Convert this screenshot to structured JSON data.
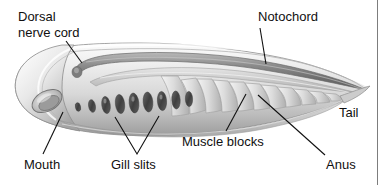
{
  "figure": {
    "organism": "lancelet",
    "orientation": "head at left, tail at right",
    "background_color": "#ffffff",
    "border_color": "#7d7d7d",
    "text_color": "#101010",
    "body_fill_light": "#f2f2f2",
    "body_fill_mid": "#cfcfcf",
    "body_fill_dark": "#8f8f8f",
    "nerve_cord_color": "#707070",
    "gill_slit_color": "#4d4d4d"
  },
  "labels": {
    "dorsal_nerve_cord_line1": "Dorsal",
    "dorsal_nerve_cord_line2": "nerve cord",
    "notochord": "Notochord",
    "tail": "Tail",
    "anus": "Anus",
    "muscle_blocks": "Muscle blocks",
    "gill_slits": "Gill slits",
    "mouth": "Mouth"
  },
  "callouts": [
    {
      "name": "dorsal-nerve-cord",
      "text": "Dorsal nerve cord",
      "text_x": 18,
      "text_y": 10,
      "leader": [
        [
          66,
          41
        ],
        [
          82,
          62
        ]
      ],
      "target": "dorsal hollow nerve cord running along the top of the body"
    },
    {
      "name": "notochord",
      "text": "Notochord",
      "text_x": 259,
      "text_y": 10,
      "leader": [
        [
          262,
          27
        ],
        [
          265,
          62
        ]
      ],
      "target": "notochord, stiff rod beneath the nerve cord"
    },
    {
      "name": "tail",
      "text": "Tail",
      "text_x": 339,
      "text_y": 106,
      "leader": [],
      "target": "pointed posterior tail"
    },
    {
      "name": "anus",
      "text": "Anus",
      "text_x": 327,
      "text_y": 159,
      "leader": [
        [
          325,
          157
        ],
        [
          258,
          95
        ]
      ],
      "target": "anus on ventral posterior body"
    },
    {
      "name": "muscle-blocks",
      "text": "Muscle blocks",
      "text_x": 183,
      "text_y": 136,
      "leader": [
        [
          225,
          133
        ],
        [
          245,
          95
        ]
      ],
      "target": "chevron-shaped myomeres (muscle blocks)"
    },
    {
      "name": "gill-slits",
      "text": "Gill slits",
      "text_x": 110,
      "text_y": 160,
      "leader_v": [
        [
          137,
          156
        ],
        [
          115,
          119
        ],
        [
          137,
          156
        ],
        [
          158,
          118
        ]
      ],
      "target": "pharyngeal gill slits"
    },
    {
      "name": "mouth",
      "text": "Mouth",
      "text_x": 25,
      "text_y": 160,
      "leader": [
        [
          42,
          156
        ],
        [
          62,
          112
        ]
      ],
      "target": "mouth opening at the anterior end"
    }
  ],
  "anatomy": {
    "gill_slit_count": 9,
    "muscle_block_count": 11
  }
}
